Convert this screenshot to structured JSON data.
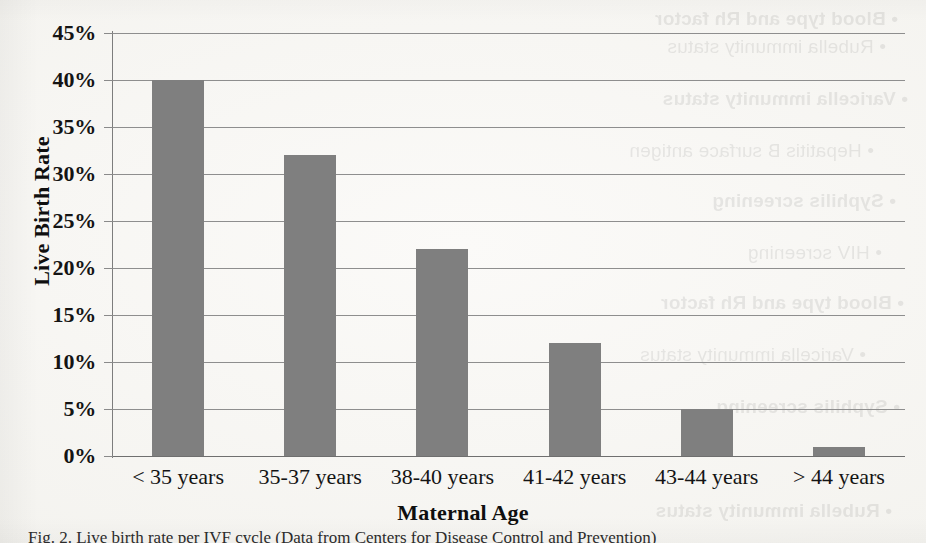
{
  "chart_data": {
    "type": "bar",
    "title": "",
    "xlabel": "Maternal Age",
    "ylabel": "Live Birth Rate",
    "categories": [
      "< 35 years",
      "35-37 years",
      "38-40 years",
      "41-42 years",
      "43-44 years",
      "> 44 years"
    ],
    "values": [
      40,
      32,
      22,
      12,
      5,
      1
    ],
    "value_labels": [
      "40%",
      "32%",
      "22%",
      "12%",
      "5%",
      "1%"
    ],
    "ylim": [
      0,
      45
    ],
    "ytick_values": [
      0,
      5,
      10,
      15,
      20,
      25,
      30,
      35,
      40,
      45
    ],
    "ytick_labels": [
      "0%",
      "5%",
      "10%",
      "15%",
      "20%",
      "25%",
      "30%",
      "35%",
      "40%",
      "45%"
    ],
    "grid": true,
    "legend": "none",
    "series": [
      {
        "name": "Live Birth Rate",
        "color": "#7f7f7f",
        "values": [
          40,
          32,
          22,
          12,
          5,
          1
        ]
      }
    ]
  },
  "axes": {
    "y_title": "Live Birth Rate",
    "x_title": "Maternal Age"
  },
  "caption": {
    "text": "Fig. 2. Live birth rate per IVF cycle (Data from Centers for Disease Control and Prevention)"
  },
  "colors": {
    "bar": "#7f7f7f",
    "gridline": "#8e8e8e",
    "axis": "#7d7d7d",
    "text": "#141414",
    "background": "#f6f5f2"
  },
  "bleed_through": {
    "lines": [
      "• Blood type and Rh factor",
      "• Rubella immunity status",
      "• Varicella immunity status",
      "• Hepatitis B surface antigen",
      "• Syphilis screening",
      "• HIV screening"
    ]
  }
}
